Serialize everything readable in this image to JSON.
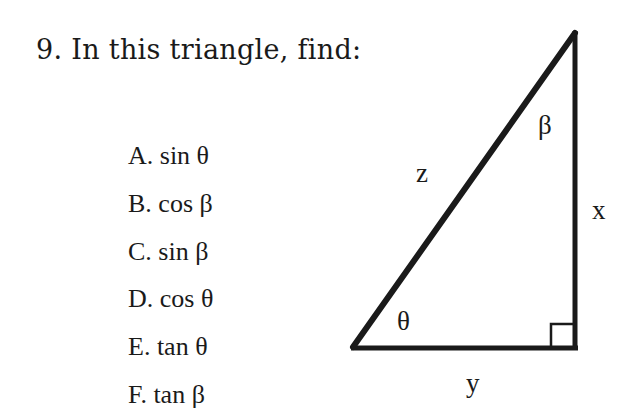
{
  "problem": {
    "title": "9. In this triangle, find:",
    "items": [
      {
        "letter": "A.",
        "text": "A. sin θ"
      },
      {
        "letter": "B.",
        "text": "B. cos β"
      },
      {
        "letter": "C.",
        "text": "C. sin β"
      },
      {
        "letter": "D.",
        "text": "D. cos θ"
      },
      {
        "letter": "E.",
        "text": "E. tan θ"
      },
      {
        "letter": "F.",
        "text": "F. tan β"
      }
    ]
  },
  "triangle": {
    "hypotenuse_label": "z",
    "vertical_leg_label": "x",
    "horizontal_leg_label": "y",
    "bottom_left_angle": "θ",
    "top_angle": "β",
    "right_angle_marker": true,
    "stroke_color": "#1a1a1a"
  }
}
